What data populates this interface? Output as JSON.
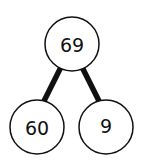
{
  "diagram": {
    "type": "number-bond",
    "whole": {
      "label": "69"
    },
    "parts": [
      {
        "label": "60"
      },
      {
        "label": "9"
      }
    ],
    "colors": {
      "stroke": "#111111",
      "fill": "#ffffff",
      "background": "#ffffff"
    }
  }
}
